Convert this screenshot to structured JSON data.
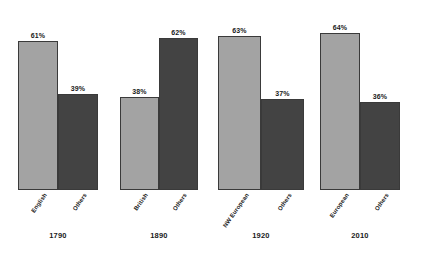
{
  "chart_data": {
    "type": "bar",
    "title": "",
    "subtitle": "",
    "xlabel": "",
    "ylabel": "",
    "ylim": [
      0,
      70
    ],
    "grid": false,
    "legend": "none",
    "categories": [
      "1790",
      "1890",
      "1920",
      "2010"
    ],
    "groups": [
      {
        "year": "1790",
        "bars": [
          {
            "label": "English",
            "value": 61,
            "value_label": "61%",
            "shade": "light",
            "color": "#a3a3a3"
          },
          {
            "label": "Others",
            "value": 39,
            "value_label": "39%",
            "shade": "dark",
            "color": "#434343"
          }
        ]
      },
      {
        "year": "1890",
        "bars": [
          {
            "label": "British",
            "value": 38,
            "value_label": "38%",
            "shade": "light",
            "color": "#a3a3a3"
          },
          {
            "label": "Others",
            "value": 62,
            "value_label": "62%",
            "shade": "dark",
            "color": "#434343"
          }
        ]
      },
      {
        "year": "1920",
        "bars": [
          {
            "label": "NW European",
            "value": 63,
            "value_label": "63%",
            "shade": "light",
            "color": "#a3a3a3"
          },
          {
            "label": "Others",
            "value": 37,
            "value_label": "37%",
            "shade": "dark",
            "color": "#434343"
          }
        ]
      },
      {
        "year": "2010",
        "bars": [
          {
            "label": "European",
            "value": 64,
            "value_label": "64%",
            "shade": "light",
            "color": "#a3a3a3"
          },
          {
            "label": "Others",
            "value": 36,
            "value_label": "36%",
            "shade": "dark",
            "color": "#434343"
          }
        ]
      }
    ],
    "series": [
      {
        "name": "Majority origin group",
        "values": [
          61,
          38,
          63,
          64
        ]
      },
      {
        "name": "Others",
        "values": [
          39,
          62,
          37,
          36
        ]
      }
    ],
    "colors": {
      "light_bar": "#a3a3a3",
      "dark_bar": "#434343",
      "bar_border": "#3a3a3a",
      "background": "#ffffff",
      "text": "#1a1a1a"
    }
  },
  "layout": {
    "group_left_px": [
      18,
      120,
      218,
      320
    ],
    "group_width_px": [
      80,
      78,
      86,
      80
    ],
    "baseline_y_px": 190,
    "value_scale_px_per_unit": 2.45
  }
}
